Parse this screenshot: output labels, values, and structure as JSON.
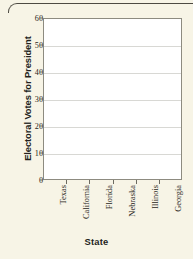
{
  "figure": {
    "background_color": "#f7f4e6",
    "plot_background_color": "#ffffff",
    "axis_color": "#8d8b80",
    "grid_color": "#d8d8d4",
    "text_color": "#231f1c"
  },
  "chart_data": {
    "type": "bar",
    "title": "",
    "subtitle": "",
    "xlabel": "State",
    "ylabel": "Electoral Votes for President",
    "categories": [
      "Texas",
      "California",
      "Florida",
      "Nebraska",
      "Illinois",
      "Georgia"
    ],
    "values": [
      null,
      null,
      null,
      null,
      null,
      null
    ],
    "series": [
      {
        "name": "Electoral Votes for President",
        "values": [
          null,
          null,
          null,
          null,
          null,
          null
        ]
      }
    ],
    "ylim": [
      0,
      60
    ],
    "ytick_labels": [
      "0",
      "10",
      "20",
      "30",
      "40",
      "50",
      "60"
    ],
    "ytick_values": [
      0,
      10,
      20,
      30,
      40,
      50,
      60
    ],
    "grid": "horizontal",
    "legend": "none",
    "annotations": [],
    "note": "Blank grid — axes drawn with no bars plotted"
  }
}
